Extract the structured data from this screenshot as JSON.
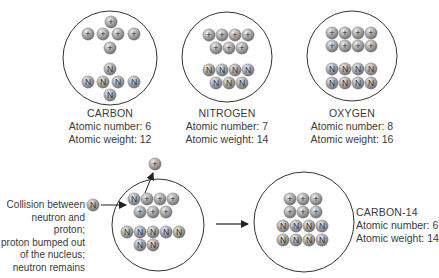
{
  "colors": {
    "ball_light": "#e8e8e8",
    "ball_mid": "#a9a9a9",
    "ball_dark": "#6f6f6f",
    "outline": "#333333",
    "text": "#3b3b3b"
  },
  "particles": {
    "proton_symbol": "+",
    "neutron_symbol": "N"
  },
  "atoms": [
    {
      "id": "carbon",
      "name": "CARBON",
      "atomic_number_text": "Atomic number: 6",
      "atomic_weight_text": "Atomic weight: 12",
      "circle": {
        "cx": 110,
        "cy": 58,
        "r": 47
      },
      "protons": [
        [
          111,
          22
        ],
        [
          88,
          34
        ],
        [
          103,
          34
        ],
        [
          118,
          34
        ],
        [
          134,
          34
        ],
        [
          110,
          48
        ]
      ],
      "neutrons": [
        [
          110,
          69
        ],
        [
          88,
          82
        ],
        [
          103,
          82
        ],
        [
          118,
          82
        ],
        [
          134,
          82
        ],
        [
          110,
          95
        ]
      ]
    },
    {
      "id": "nitrogen",
      "name": "NITROGEN",
      "atomic_number_text": "Atomic number: 7",
      "atomic_weight_text": "Atomic weight: 14",
      "circle": {
        "cx": 227,
        "cy": 57,
        "r": 45
      },
      "protons": [
        [
          209,
          35
        ],
        [
          222,
          35
        ],
        [
          235,
          35
        ],
        [
          248,
          35
        ],
        [
          216,
          48
        ],
        [
          229,
          48
        ],
        [
          242,
          48
        ]
      ],
      "neutrons": [
        [
          209,
          70
        ],
        [
          222,
          70
        ],
        [
          235,
          70
        ],
        [
          248,
          70
        ],
        [
          216,
          83
        ],
        [
          229,
          83
        ],
        [
          242,
          83
        ]
      ]
    },
    {
      "id": "oxygen",
      "name": "OXYGEN",
      "atomic_number_text": "Atomic number: 8",
      "atomic_weight_text": "Atomic weight: 16",
      "circle": {
        "cx": 352,
        "cy": 56,
        "r": 45
      },
      "protons": [
        [
          332,
          33
        ],
        [
          345,
          33
        ],
        [
          358,
          33
        ],
        [
          371,
          33
        ],
        [
          332,
          46
        ],
        [
          345,
          46
        ],
        [
          358,
          46
        ],
        [
          371,
          46
        ]
      ],
      "neutrons": [
        [
          332,
          69
        ],
        [
          345,
          69
        ],
        [
          358,
          69
        ],
        [
          371,
          69
        ],
        [
          332,
          83
        ],
        [
          345,
          83
        ],
        [
          358,
          83
        ],
        [
          371,
          83
        ]
      ]
    },
    {
      "id": "collision",
      "circle": {
        "cx": 158,
        "cy": 225,
        "r": 46
      },
      "protons": [
        [
          147,
          199
        ],
        [
          160,
          199
        ],
        [
          173,
          199
        ],
        [
          140,
          212
        ],
        [
          153,
          212
        ],
        [
          166,
          212
        ]
      ],
      "neutrons": [
        [
          134,
          199
        ],
        [
          127,
          232
        ],
        [
          140,
          232
        ],
        [
          153,
          232
        ],
        [
          166,
          232
        ],
        [
          179,
          232
        ],
        [
          140,
          245
        ],
        [
          153,
          245
        ]
      ]
    },
    {
      "id": "carbon-14",
      "name": "CARBON-14",
      "atomic_number_text": "Atomic number: 6",
      "atomic_weight_text": "Atomic weight: 14",
      "circle": {
        "cx": 304,
        "cy": 222,
        "r": 50
      },
      "protons": [
        [
          290,
          199
        ],
        [
          303,
          199
        ],
        [
          316,
          199
        ],
        [
          290,
          212
        ],
        [
          303,
          212
        ],
        [
          316,
          212
        ]
      ],
      "neutrons": [
        [
          283,
          226
        ],
        [
          296,
          226
        ],
        [
          309,
          226
        ],
        [
          322,
          226
        ],
        [
          283,
          240
        ],
        [
          296,
          240
        ],
        [
          309,
          240
        ],
        [
          322,
          240
        ]
      ]
    }
  ],
  "collision": {
    "incoming_neutron": [
      93,
      205
    ],
    "ejected_proton": [
      155,
      164
    ],
    "note_lines": [
      "Collision between",
      "neutron and proton;",
      "proton bumped out",
      "of the nucleus;",
      "neutron remains"
    ]
  },
  "transition_arrow": {
    "x1": 216,
    "x2": 248,
    "y": 224
  }
}
